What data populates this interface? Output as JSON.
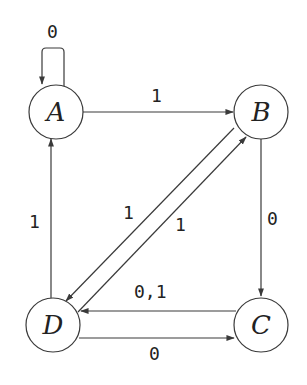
{
  "diagram": {
    "type": "finite-automaton",
    "nodes": [
      {
        "id": "A",
        "label": "A"
      },
      {
        "id": "B",
        "label": "B"
      },
      {
        "id": "C",
        "label": "C"
      },
      {
        "id": "D",
        "label": "D"
      }
    ],
    "edges": [
      {
        "from": "A",
        "to": "A",
        "label": "0"
      },
      {
        "from": "A",
        "to": "B",
        "label": "1"
      },
      {
        "from": "B",
        "to": "C",
        "label": "0"
      },
      {
        "from": "B",
        "to": "D",
        "label": "1"
      },
      {
        "from": "D",
        "to": "B",
        "label": "1"
      },
      {
        "from": "C",
        "to": "D",
        "label": "0,1"
      },
      {
        "from": "D",
        "to": "C",
        "label": "0"
      },
      {
        "from": "D",
        "to": "A",
        "label": "1"
      }
    ]
  },
  "colors": {
    "stroke": "#3a3a3a",
    "text": "#222222",
    "background": "#ffffff"
  }
}
